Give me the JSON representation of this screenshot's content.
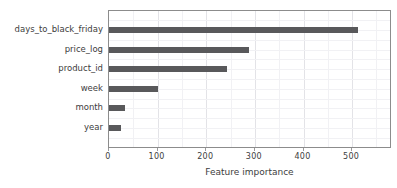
{
  "chart_data": {
    "type": "bar",
    "orientation": "horizontal",
    "title": "",
    "xlabel": "Feature importance",
    "ylabel": "",
    "categories": [
      "days_to_black_friday",
      "price_log",
      "product_id",
      "week",
      "month",
      "year"
    ],
    "values": [
      512,
      288,
      243,
      100,
      32,
      24
    ],
    "x_ticks": [
      0,
      100,
      200,
      300,
      400,
      500
    ],
    "x_minor_ticks": [
      50,
      150,
      250,
      350,
      450,
      550
    ],
    "xlim": [
      0,
      582
    ],
    "grid": true,
    "legend": false,
    "bar_color": "#59595b"
  },
  "colors": {
    "bar": "#59595b",
    "plot_border": "#8c8c8c",
    "text": "#3d3d3d",
    "grid_major": "#e3e3e7",
    "grid_minor": "#f1f1f4",
    "background": "#ffffff"
  }
}
